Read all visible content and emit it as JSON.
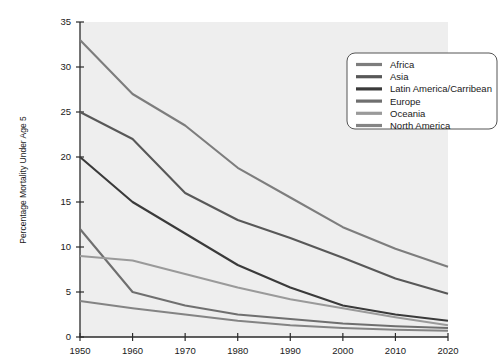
{
  "chart_data": {
    "type": "line",
    "title": "",
    "xlabel": "",
    "ylabel": "Percentage Mortality Under Age 5",
    "x": [
      1950,
      1960,
      1970,
      1980,
      1990,
      2000,
      2010,
      2020
    ],
    "xtick_labels": [
      "1950",
      "1960",
      "1970",
      "1980",
      "1990",
      "2000",
      "2010",
      "2020"
    ],
    "ytick_labels": [
      "0",
      "5",
      "10",
      "15",
      "20",
      "25",
      "30",
      "35"
    ],
    "yticks": [
      0,
      5,
      10,
      15,
      20,
      25,
      30,
      35
    ],
    "xlim": [
      1950,
      2020
    ],
    "ylim": [
      0,
      35
    ],
    "grid": false,
    "legend_position": "upper right",
    "series": [
      {
        "name": "Africa",
        "color": "#7d7d7d",
        "values": [
          33.0,
          27.0,
          23.5,
          18.8,
          15.5,
          12.2,
          9.8,
          7.8
        ]
      },
      {
        "name": "Asia",
        "color": "#585858",
        "values": [
          25.0,
          22.0,
          16.0,
          13.0,
          11.0,
          8.8,
          6.5,
          4.8
        ]
      },
      {
        "name": "Latin America/Carribean",
        "color": "#3a3a3a",
        "values": [
          20.0,
          15.0,
          11.5,
          8.0,
          5.5,
          3.5,
          2.5,
          1.8
        ]
      },
      {
        "name": "Europe",
        "color": "#6f6f6f",
        "values": [
          12.0,
          5.0,
          3.5,
          2.5,
          2.0,
          1.5,
          1.2,
          1.0
        ]
      },
      {
        "name": "Oceania",
        "color": "#9a9a9a",
        "values": [
          9.0,
          8.5,
          7.0,
          5.5,
          4.2,
          3.2,
          2.2,
          1.3
        ]
      },
      {
        "name": "North America",
        "color": "#848484",
        "values": [
          4.0,
          3.2,
          2.5,
          1.8,
          1.3,
          1.0,
          0.8,
          0.7
        ]
      }
    ]
  },
  "axes": {
    "y_axis_title": "Percentage Mortality Under Age 5"
  },
  "legend": {
    "items": [
      {
        "label": "Africa"
      },
      {
        "label": "Asia"
      },
      {
        "label": "Latin America/Carribean"
      },
      {
        "label": "Europe"
      },
      {
        "label": "Oceania"
      },
      {
        "label": "North America"
      }
    ]
  }
}
